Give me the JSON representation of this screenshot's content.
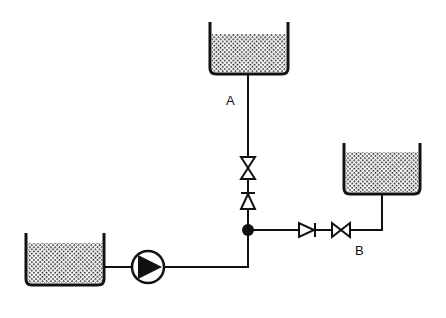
{
  "diagram": {
    "type": "piping schematic",
    "labels": {
      "a": "A",
      "b": "B"
    },
    "components": [
      {
        "id": "tank-source",
        "kind": "open tank",
        "position": "bottom-left"
      },
      {
        "id": "pump",
        "kind": "centrifugal pump",
        "position": "bottom"
      },
      {
        "id": "junction",
        "kind": "pipe junction"
      },
      {
        "id": "check-valve-a",
        "kind": "check valve",
        "branch": "A"
      },
      {
        "id": "gate-valve-a",
        "kind": "gate valve",
        "branch": "A"
      },
      {
        "id": "tank-a",
        "kind": "open tank",
        "position": "top",
        "branch": "A"
      },
      {
        "id": "check-valve-b",
        "kind": "check valve",
        "branch": "B"
      },
      {
        "id": "gate-valve-b",
        "kind": "gate valve",
        "branch": "B"
      },
      {
        "id": "tank-b",
        "kind": "open tank",
        "position": "right",
        "branch": "B"
      }
    ],
    "colors": {
      "line": "#111111",
      "fill_pattern": "#222222",
      "background": "#ffffff"
    }
  }
}
